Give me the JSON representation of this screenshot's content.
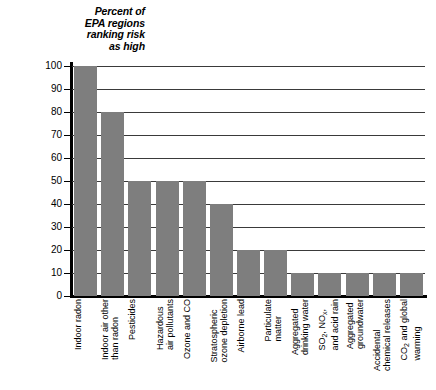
{
  "chart_data": {
    "type": "bar",
    "title": "Percent of\nEPA regions\nranking risk\nas high",
    "xlabel": "",
    "ylabel": "",
    "ylim": [
      0,
      100
    ],
    "ytick_labels": [
      "100",
      "90",
      "80",
      "70",
      "60",
      "50",
      "40",
      "30",
      "20",
      "10",
      "0"
    ],
    "ytick_values": [
      100,
      90,
      80,
      70,
      60,
      50,
      40,
      30,
      20,
      10,
      0
    ],
    "grid": true,
    "legend": "none",
    "bar_color": "#7e7e7e",
    "axis_color": "#000000",
    "grid_color": "#3a3a3a",
    "categories": [
      "Indoor radon",
      "Indoor air other\nthan radon",
      "Pesticides",
      "Hazardous\nair pollutants",
      "Ozone and CO",
      "Stratospheric\nozone depletion",
      "Airborne lead",
      "Particulate\nmatter",
      "Aggregated\ndrinking water",
      "SO2, NOx,\nand acid rain",
      "Aggregated\ngroundwater",
      "Accidental\nchemical releases",
      "CO2 and global\nwarming"
    ],
    "values": [
      100,
      80,
      50,
      50,
      50,
      40,
      20,
      20,
      10,
      10,
      10,
      10,
      10
    ]
  }
}
